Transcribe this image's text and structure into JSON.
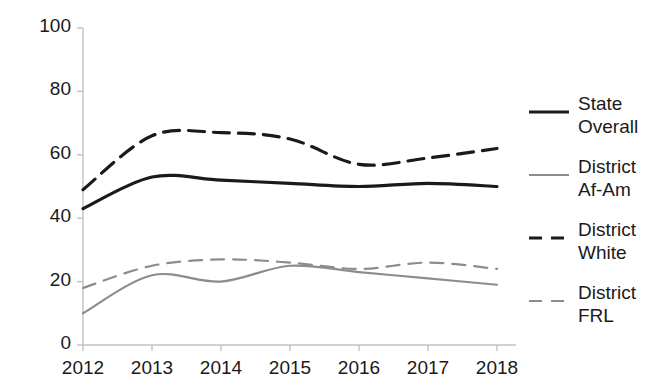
{
  "chart_data": {
    "type": "line",
    "title": "",
    "xlabel": "",
    "ylabel": "",
    "x": [
      2012,
      2013,
      2014,
      2015,
      2016,
      2017,
      2018
    ],
    "categories": [
      "2012",
      "2013",
      "2014",
      "2015",
      "2016",
      "2017",
      "2018"
    ],
    "xlim": [
      2012,
      2018
    ],
    "ylim": [
      0,
      100
    ],
    "yticks": [
      0,
      20,
      40,
      60,
      80,
      100
    ],
    "ytick_labels": [
      "0",
      "20",
      "40",
      "60",
      "80",
      "100"
    ],
    "xtick_labels": [
      "2012",
      "2013",
      "2014",
      "2015",
      "2016",
      "2017",
      "2018"
    ],
    "grid": false,
    "legend_position": "right",
    "series": [
      {
        "name": "State Overall",
        "label": "State\nOverall",
        "values": [
          43,
          53,
          52,
          51,
          50,
          51,
          50
        ],
        "color": "#1a1a1a",
        "style": "solid",
        "width": 3.2
      },
      {
        "name": "District Af-Am",
        "label": "District\nAf-Am",
        "values": [
          10,
          22,
          20,
          25,
          23,
          21,
          19
        ],
        "color": "#8c8c8c",
        "style": "solid",
        "width": 2.2
      },
      {
        "name": "District White",
        "label": "District\nWhite",
        "values": [
          49,
          66,
          67,
          65,
          57,
          59,
          62
        ],
        "color": "#1a1a1a",
        "style": "dashed",
        "width": 3.2
      },
      {
        "name": "District FRL",
        "label": "District\nFRL",
        "values": [
          18,
          25,
          27,
          26,
          24,
          26,
          24
        ],
        "color": "#8c8c8c",
        "style": "dashed",
        "width": 2.2
      }
    ]
  },
  "axis": {
    "axis_color": "#b8b8b8"
  }
}
